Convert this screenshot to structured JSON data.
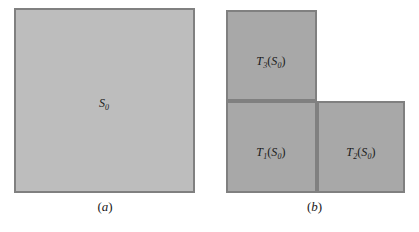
{
  "figure": {
    "type": "math-diagram",
    "colors": {
      "panel_a_fill": "#bdbdbd",
      "panel_b_fill": "#a8a8a8",
      "border": "#808080",
      "text": "#1a1a1a",
      "background": "#ffffff"
    },
    "panels": [
      {
        "caption": "(a)",
        "caption_open_paren": "(",
        "caption_letter": "a",
        "caption_close_paren": ")",
        "shapes": [
          {
            "name": "S0",
            "base": "S",
            "subscript": "0",
            "label_plain": "S0",
            "x": 14,
            "y": 8,
            "width": 181,
            "height": 185,
            "fill": "#bdbdbd"
          }
        ]
      },
      {
        "caption": "(b)",
        "caption_open_paren": "(",
        "caption_letter": "b",
        "caption_close_paren": ")",
        "shapes": [
          {
            "name": "T3(S0)",
            "map_base": "T",
            "map_subscript": "3",
            "open_paren": "(",
            "arg_base": "S",
            "arg_subscript": "0",
            "close_paren": ")",
            "label_plain": "T3(S0)",
            "x": 16,
            "y": 10,
            "width": 91,
            "height": 91,
            "fill": "#a8a8a8"
          },
          {
            "name": "T1(S0)",
            "map_base": "T",
            "map_subscript": "1",
            "open_paren": "(",
            "arg_base": "S",
            "arg_subscript": "0",
            "close_paren": ")",
            "label_plain": "T1(S0)",
            "x": 16,
            "y": 101,
            "width": 91,
            "height": 92,
            "fill": "#a8a8a8"
          },
          {
            "name": "T2(S0)",
            "map_base": "T",
            "map_subscript": "2",
            "open_paren": "(",
            "arg_base": "S",
            "arg_subscript": "0",
            "close_paren": ")",
            "label_plain": "T2(S0)",
            "x": 107,
            "y": 101,
            "width": 88,
            "height": 92,
            "fill": "#a8a8a8"
          }
        ]
      }
    ]
  }
}
